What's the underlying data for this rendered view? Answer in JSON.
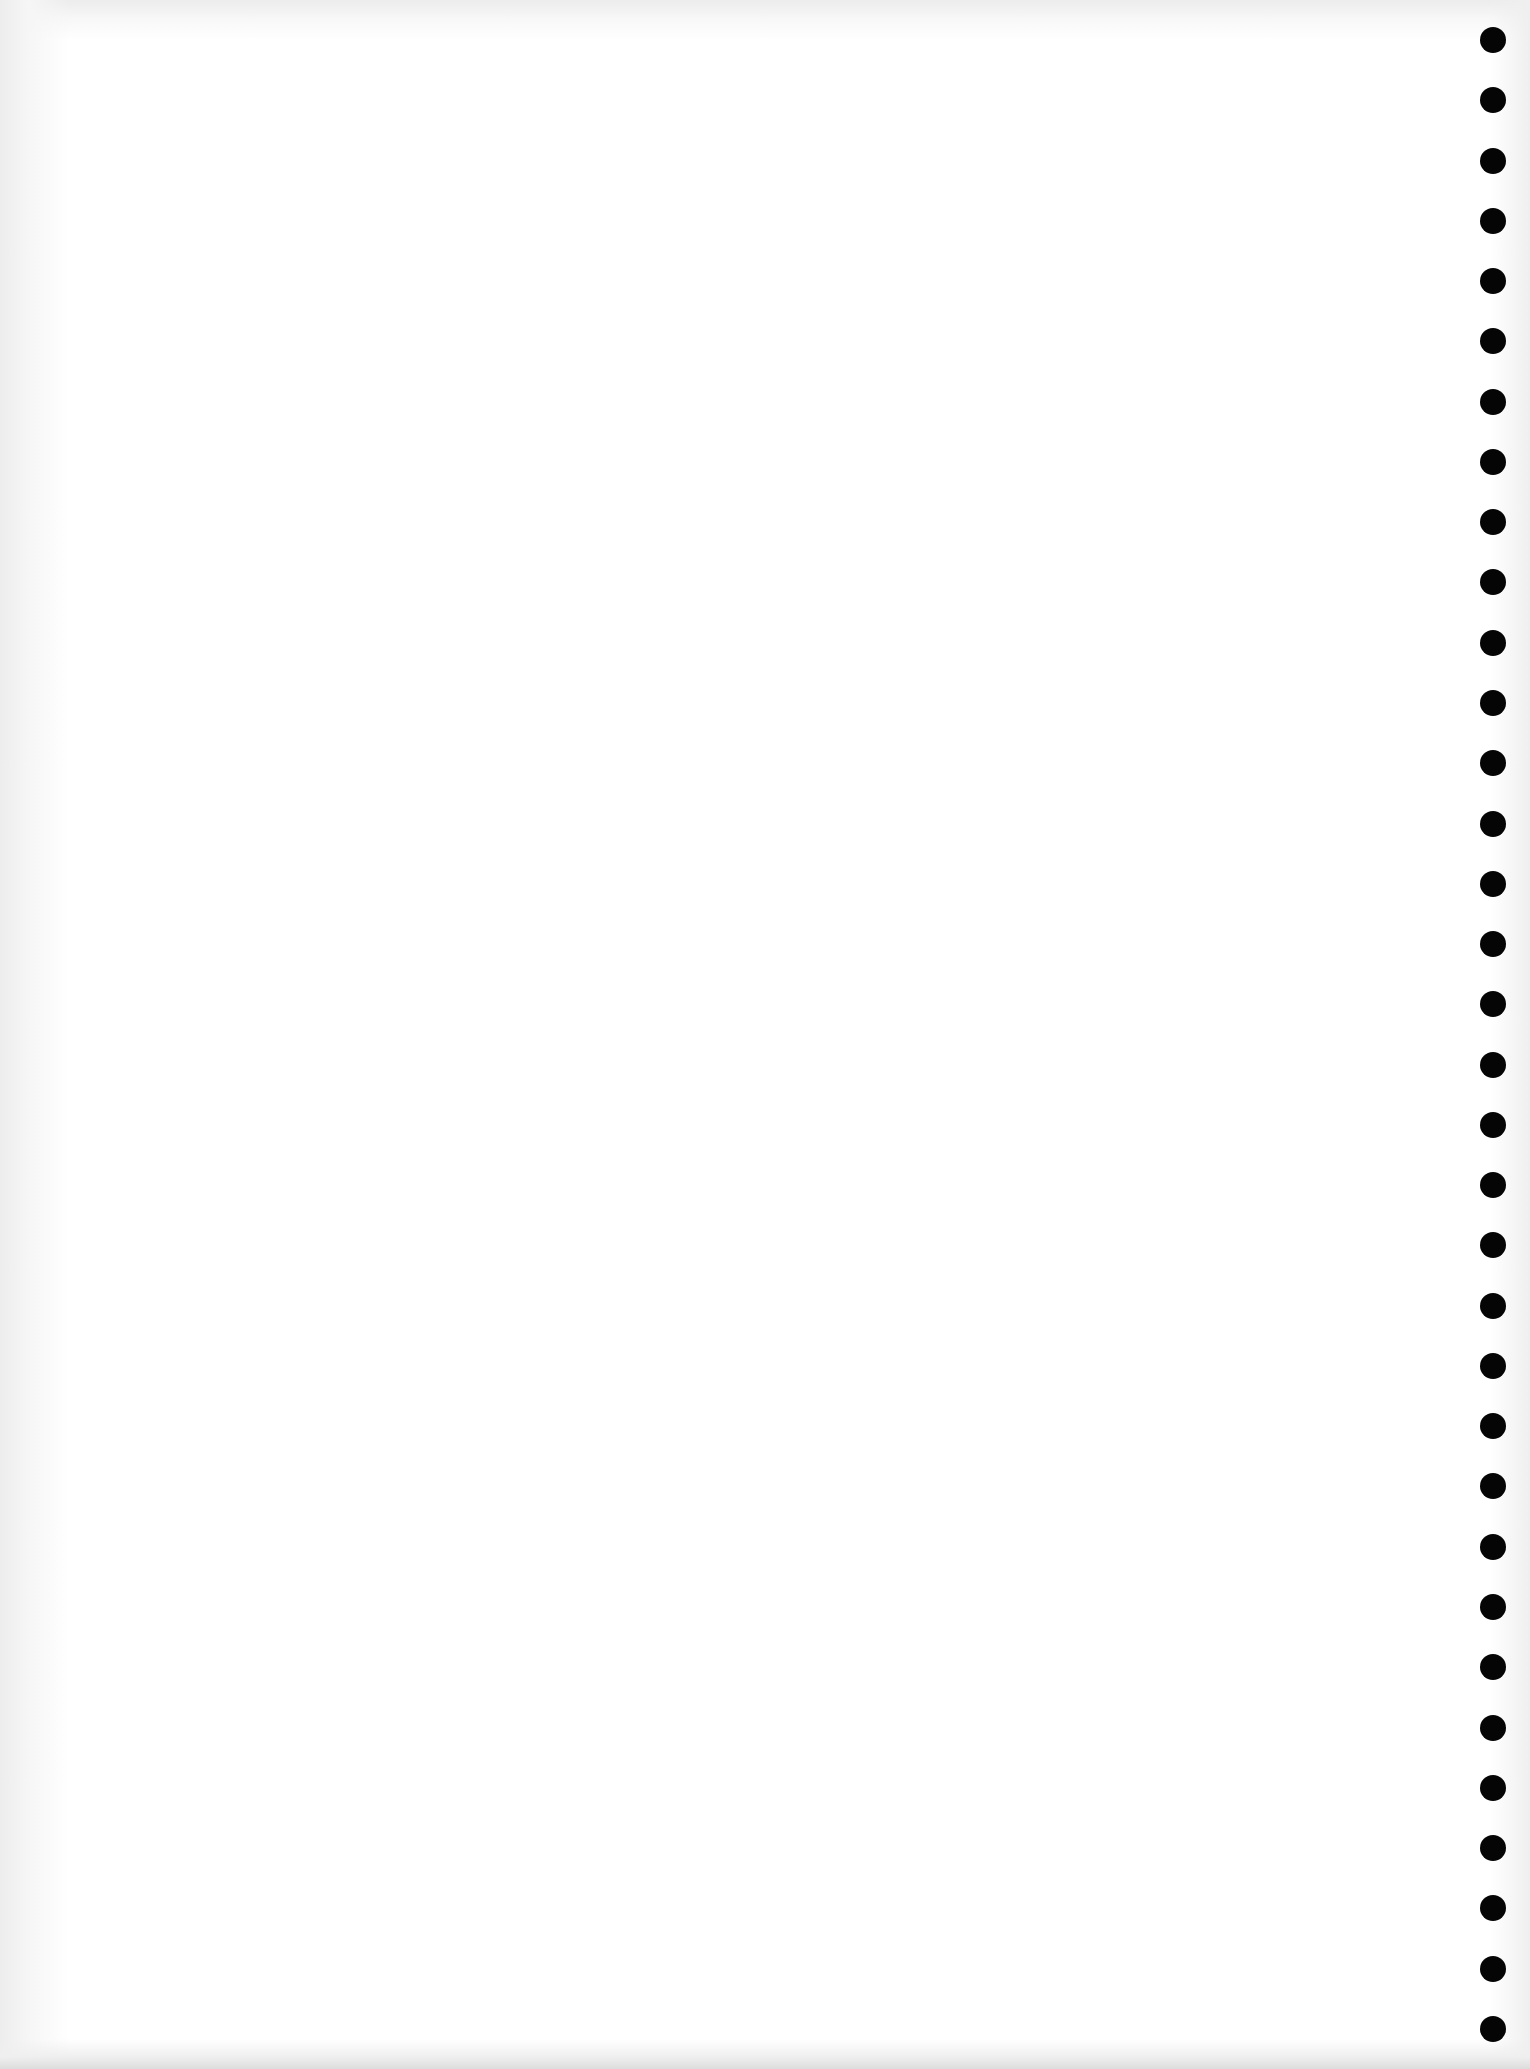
{
  "document": {
    "type": "blank-notebook-page",
    "background_color": "#ffffff",
    "shadow_color": "#e6e6e6",
    "text_content": ""
  },
  "perforations": {
    "count": 34,
    "color": "#050505",
    "center_x": 1493,
    "first_center_y": 40,
    "spacing_y": 60.27,
    "diameter": 26
  }
}
